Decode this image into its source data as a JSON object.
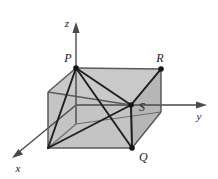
{
  "figure": {
    "name": "rectangular-box-with-coordinate-axes",
    "background_color": "#ffffff",
    "width": 218,
    "height": 179
  },
  "axes": {
    "z": {
      "label": "z",
      "label_x": 68,
      "label_y": 23,
      "direction": "up"
    },
    "y": {
      "label": "y",
      "label_x": 199,
      "label_y": 119,
      "direction": "right"
    },
    "x": {
      "label": "x",
      "label_x": 17,
      "label_y": 170,
      "direction": "down-left"
    },
    "origin_x": 76,
    "origin_y": 105,
    "color": "#4a4a4a"
  },
  "box": {
    "fill_top": "#c9c9c9",
    "fill_front": "#c4c4c4",
    "fill_left": "#bdbdbd",
    "fill_right": "#b6b6b6",
    "edge_color": "#5a5a5a",
    "hidden_edge_color": "#6e6e6e"
  },
  "vertices": [
    {
      "id": "P",
      "label": "P",
      "x": 76,
      "y": 68,
      "label_x": 66,
      "label_y": 60,
      "marked": true
    },
    {
      "id": "R",
      "label": "R",
      "x": 161,
      "y": 69,
      "label_x": 157,
      "label_y": 60,
      "marked": true
    },
    {
      "id": "S",
      "label": "S",
      "x": 131,
      "y": 105,
      "label_x": 137,
      "label_y": 111,
      "marked": true
    },
    {
      "id": "Q",
      "label": "Q",
      "x": 132,
      "y": 148,
      "label_x": 138,
      "label_y": 160,
      "marked": true
    }
  ],
  "diagonals": [
    {
      "from": "P",
      "to": "S"
    },
    {
      "from": "P",
      "to": "Q"
    },
    {
      "from": "P",
      "to": "R"
    },
    {
      "from": "R",
      "to": "S"
    },
    {
      "from": "S",
      "to": "Q"
    }
  ],
  "marker": {
    "radius": 2.6,
    "color": "#161616"
  }
}
